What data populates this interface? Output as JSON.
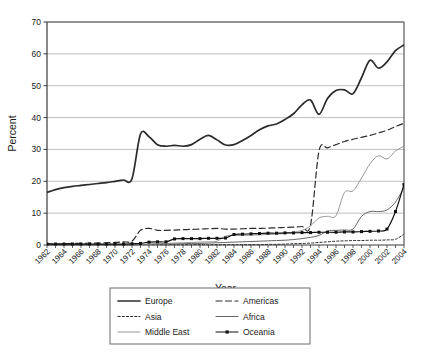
{
  "chart_data": {
    "type": "line",
    "title": "",
    "xlabel": "Year",
    "ylabel": "Percent",
    "xlim": [
      1962,
      2004
    ],
    "ylim": [
      0,
      70
    ],
    "yticks": [
      0,
      10,
      20,
      30,
      40,
      50,
      60,
      70
    ],
    "grid": "horizontal",
    "legend_position": "bottom",
    "x": [
      1962,
      1963,
      1964,
      1965,
      1966,
      1967,
      1968,
      1969,
      1970,
      1971,
      1972,
      1973,
      1974,
      1975,
      1976,
      1977,
      1978,
      1979,
      1980,
      1981,
      1982,
      1983,
      1984,
      1985,
      1986,
      1987,
      1988,
      1989,
      1990,
      1991,
      1992,
      1993,
      1994,
      1995,
      1996,
      1997,
      1998,
      1999,
      2000,
      2001,
      2002,
      2003,
      2004
    ],
    "xticks": [
      "1962",
      "1964",
      "1966",
      "1968",
      "1970",
      "1972",
      "1974",
      "1976",
      "1978",
      "1980",
      "1982",
      "1984",
      "1986",
      "1988",
      "1990",
      "1992",
      "1994",
      "1996",
      "1998",
      "2000",
      "2002",
      "2004"
    ],
    "series": [
      {
        "name": "Europe",
        "style": "solid-thick",
        "color": "#2b2b2b",
        "values": [
          16.5,
          17.4,
          18.0,
          18.4,
          18.7,
          19.0,
          19.3,
          19.6,
          20.0,
          20.4,
          20.8,
          34.8,
          34.0,
          31.5,
          31.0,
          31.3,
          31.0,
          31.5,
          33.2,
          34.4,
          33.0,
          31.4,
          31.5,
          32.8,
          34.4,
          36.2,
          37.4,
          38.0,
          39.4,
          41.2,
          44.0,
          45.5,
          41.0,
          46.0,
          48.5,
          48.7,
          47.5,
          52.5,
          58.0,
          55.5,
          57.5,
          61.0,
          62.8
        ]
      },
      {
        "name": "Americas",
        "style": "dashed-long",
        "color": "#2b2b2b",
        "values": [
          0.4,
          0.4,
          0.4,
          0.5,
          0.5,
          0.6,
          0.6,
          0.7,
          0.8,
          1.0,
          1.2,
          4.6,
          5.2,
          4.6,
          4.6,
          4.7,
          4.8,
          4.9,
          5.0,
          5.1,
          5.2,
          5.0,
          5.0,
          5.1,
          5.2,
          5.2,
          5.3,
          5.4,
          5.5,
          5.6,
          5.8,
          6.2,
          29.5,
          30.5,
          31.5,
          32.5,
          33.2,
          33.8,
          34.4,
          35.2,
          36.0,
          37.2,
          38.2
        ]
      },
      {
        "name": "Asia",
        "style": "dotted",
        "color": "#2b2b2b",
        "values": [
          0.1,
          0.1,
          0.1,
          0.1,
          0.1,
          0.1,
          0.1,
          0.1,
          0.1,
          0.1,
          0.1,
          0.1,
          0.1,
          0.1,
          0.1,
          0.1,
          0.1,
          0.1,
          0.1,
          0.1,
          0.1,
          0.1,
          0.1,
          0.1,
          0.1,
          0.1,
          0.2,
          0.2,
          0.3,
          0.4,
          0.5,
          0.6,
          0.8,
          1.0,
          1.2,
          1.3,
          1.4,
          1.4,
          1.5,
          1.5,
          1.6,
          1.8,
          3.4
        ]
      },
      {
        "name": "Africa",
        "style": "solid-thin",
        "color": "#555555",
        "values": [
          0.0,
          0.0,
          0.0,
          0.0,
          0.0,
          0.0,
          0.0,
          0.0,
          0.0,
          0.0,
          0.0,
          0.1,
          0.2,
          0.3,
          0.3,
          0.4,
          0.4,
          0.5,
          0.5,
          0.6,
          0.7,
          0.8,
          0.9,
          1.0,
          1.1,
          1.2,
          1.3,
          1.4,
          1.5,
          1.7,
          2.0,
          2.4,
          3.0,
          4.4,
          4.6,
          4.7,
          5.0,
          9.0,
          10.5,
          10.5,
          11.0,
          13.5,
          18.0
        ]
      },
      {
        "name": "Middle East",
        "style": "solid-gray",
        "color": "#8a8a8a",
        "values": [
          0.0,
          0.0,
          0.0,
          0.0,
          0.0,
          0.0,
          0.0,
          0.0,
          0.0,
          0.0,
          0.0,
          0.2,
          0.3,
          0.4,
          0.5,
          0.6,
          0.7,
          0.8,
          0.9,
          1.0,
          1.2,
          2.8,
          3.0,
          3.0,
          3.1,
          3.2,
          3.3,
          3.4,
          3.6,
          4.0,
          4.6,
          6.0,
          8.5,
          9.0,
          9.2,
          16.5,
          17.0,
          21.0,
          25.5,
          28.0,
          27.0,
          29.5,
          31.0
        ]
      },
      {
        "name": "Oceania",
        "style": "solid-marker",
        "color": "#111111",
        "marker": "square",
        "values": [
          0.3,
          0.3,
          0.3,
          0.3,
          0.3,
          0.3,
          0.3,
          0.3,
          0.3,
          0.3,
          0.4,
          0.5,
          0.9,
          1.0,
          1.0,
          1.9,
          2.0,
          2.0,
          2.0,
          2.1,
          2.1,
          2.2,
          3.3,
          3.4,
          3.5,
          3.6,
          3.7,
          3.7,
          3.8,
          3.8,
          3.9,
          3.9,
          4.0,
          4.0,
          4.0,
          4.1,
          4.1,
          4.2,
          4.3,
          4.4,
          5.0,
          10.5,
          19.0
        ]
      }
    ]
  },
  "legend": {
    "items": [
      {
        "label": "Europe"
      },
      {
        "label": "Africa"
      },
      {
        "label": "Americas"
      },
      {
        "label": "Middle East"
      },
      {
        "label": "Asia"
      },
      {
        "label": "Oceania"
      }
    ]
  }
}
